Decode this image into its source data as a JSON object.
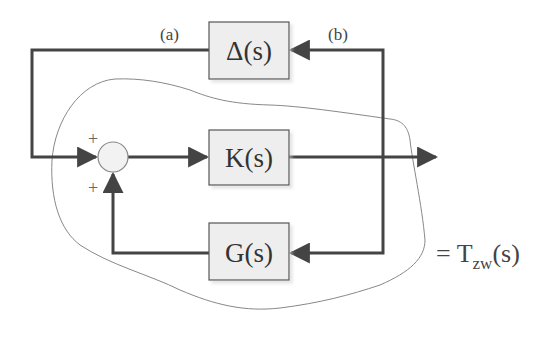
{
  "diagram": {
    "blocks": [
      {
        "id": "delta",
        "label": "Δ(s)"
      },
      {
        "id": "controller",
        "label": "K(s)"
      },
      {
        "id": "plant",
        "label": "G(s)"
      }
    ],
    "signal_labels": {
      "a": "(a)",
      "b": "(b)"
    },
    "summing_junction": {
      "sign_left": "+",
      "sign_bottom": "+"
    },
    "transfer_function": {
      "prefix": "= T",
      "subscript": "zw",
      "suffix": "(s)"
    },
    "colors": {
      "line": "#444444",
      "block_fill": "#eeeeee",
      "block_border": "#555555",
      "contour": "#888888"
    }
  }
}
